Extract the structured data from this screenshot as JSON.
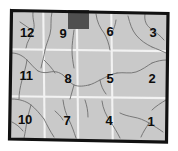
{
  "figure": {
    "kind": "map",
    "width": 178,
    "height": 151,
    "background_color": "#ffffff"
  },
  "map": {
    "land_fill_color": "#c9c9c9",
    "border_color": "#111111",
    "grid_line_color": "#f2f2f2",
    "stream_color": "#6e6e6e",
    "label_color": "#0d0d0d",
    "highlight_color": "#4f4f4f",
    "outline": [
      [
        11.5,
        10.5
      ],
      [
        168.0,
        13.5
      ],
      [
        166.5,
        142.0
      ],
      [
        9.5,
        139.0
      ]
    ],
    "grid": {
      "columns": 4,
      "rows": 3,
      "vertical_lines": [
        44,
        77.5,
        112
      ],
      "horizontal_lines": [
        50,
        97
      ]
    },
    "highlight_rect": {
      "name": "shaded-study-plot",
      "x": 68,
      "y": 10,
      "width": 21,
      "height": 19,
      "fill": "#4f4f4f"
    },
    "cells": [
      {
        "label": "12",
        "x": 27,
        "y": 32,
        "row": 1,
        "column": 1
      },
      {
        "label": "9",
        "x": 63,
        "y": 33,
        "row": 1,
        "column": 2
      },
      {
        "label": "6",
        "x": 110,
        "y": 31,
        "row": 1,
        "column": 3
      },
      {
        "label": "3",
        "x": 153,
        "y": 32,
        "row": 1,
        "column": 4
      },
      {
        "label": "11",
        "x": 26,
        "y": 75,
        "row": 2,
        "column": 1
      },
      {
        "label": "8",
        "x": 68,
        "y": 78,
        "row": 2,
        "column": 2
      },
      {
        "label": "5",
        "x": 110,
        "y": 78,
        "row": 2,
        "column": 3
      },
      {
        "label": "2",
        "x": 152,
        "y": 78,
        "row": 2,
        "column": 4
      },
      {
        "label": "10",
        "x": 25,
        "y": 119,
        "row": 3,
        "column": 1
      },
      {
        "label": "7",
        "x": 67,
        "y": 120,
        "row": 3,
        "column": 2
      },
      {
        "label": "4",
        "x": 109,
        "y": 120,
        "row": 3,
        "column": 3
      },
      {
        "label": "1",
        "x": 151,
        "y": 121,
        "row": 3,
        "column": 4
      }
    ],
    "streams": [
      "M 33 12 C 32 20, 36 25, 33 31 C 31 37, 27 41, 26 48",
      "M 20 22 C 26 26, 30 29, 33 31",
      "M 52 12 C 50 20, 52 27, 50 34 C 48 41, 46 45, 45 50",
      "M 45 50 C 44 57, 42 62, 41 68",
      "M 74 30 C 73 38, 72 44, 72 50 C 72 57, 73 62, 74 68",
      "M 96 14 C 97 22, 100 28, 104 33 C 107 38, 109 44, 110 50",
      "M 116 20 C 115 27, 113 31, 110 35",
      "M 128 16 C 130 24, 132 30, 136 35 C 141 41, 146 44, 152 47",
      "M 145 14 C 144 20, 146 25, 150 28 C 155 32, 160 35, 164 40",
      "M 152 47 C 157 49, 162 51, 166 53",
      "M 12 53 C 18 53, 23 56, 27 60 C 31 64, 34 68, 38 71",
      "M 27 60 C 26 67, 24 73, 22 80 C 20 88, 19 93, 19 99",
      "M 38 71 C 42 73, 46 73, 50 72 C 55 71, 59 72, 63 75",
      "M 63 75 C 67 79, 70 83, 74 85 C 79 87, 84 86, 89 85",
      "M 89 85 C 93 84, 96 82, 100 80 C 106 77, 111 74, 117 73",
      "M 117 73 C 124 72, 130 74, 136 72 C 142 70, 147 66, 152 63",
      "M 152 63 C 157 61, 162 60, 166 60",
      "M 74 85 C 73 90, 71 94, 70 99",
      "M 100 80 C 101 86, 103 90, 106 94",
      "M 44 60 C 48 64, 52 68, 55 73",
      "M 12 99 C 19 99, 26 101, 31 105 C 36 109, 40 114, 44 119",
      "M 31 105 C 29 112, 27 119, 26 127 C 25 134, 24 137, 24 139",
      "M 44 119 C 47 125, 50 131, 54 137",
      "M 63 100 C 64 108, 66 114, 69 120 C 72 126, 74 132, 76 138",
      "M 55 111 C 58 114, 61 116, 63 120",
      "M 102 101 C 103 109, 106 115, 110 121 C 114 127, 117 132, 120 138",
      "M 120 113 C 124 115, 128 116, 133 117 C 139 118, 144 120, 149 123",
      "M 149 123 C 154 126, 159 129, 163 132",
      "M 149 123 C 146 128, 143 132, 141 137",
      "M 166 100 C 161 103, 156 106, 152 110",
      "M 12 122 C 16 124, 20 127, 23 131",
      "M 85 100 C 87 106, 88 111, 88 117"
    ]
  }
}
